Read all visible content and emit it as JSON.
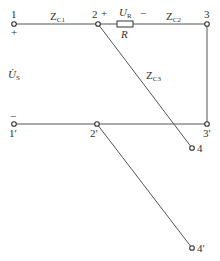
{
  "diagram": {
    "type": "circuit",
    "nodes": [
      {
        "id": "1",
        "label": "1",
        "x": 14,
        "y": 24
      },
      {
        "id": "2",
        "label": "2",
        "x": 98,
        "y": 24
      },
      {
        "id": "3",
        "label": "3",
        "x": 207,
        "y": 24
      },
      {
        "id": "1p",
        "label": "1′",
        "x": 14,
        "y": 124
      },
      {
        "id": "2p",
        "label": "2′",
        "x": 97,
        "y": 124
      },
      {
        "id": "3p",
        "label": "3′",
        "x": 207,
        "y": 124
      },
      {
        "id": "4",
        "label": "4",
        "x": 192,
        "y": 148
      },
      {
        "id": "4p",
        "label": "4′",
        "x": 192,
        "y": 248
      }
    ],
    "labels": {
      "zc1_main": "Z",
      "zc1_sub": "C1",
      "zc2_main": "Z",
      "zc2_sub": "C2",
      "zc3_main": "Z",
      "zc3_sub": "C3",
      "ur_main": "U",
      "ur_sub": "R",
      "r": "R",
      "us_main": "U̇",
      "us_sub": "S",
      "plus_1": "+",
      "plus_2": "+",
      "minus_r": "−",
      "minus_1p": "−"
    }
  }
}
